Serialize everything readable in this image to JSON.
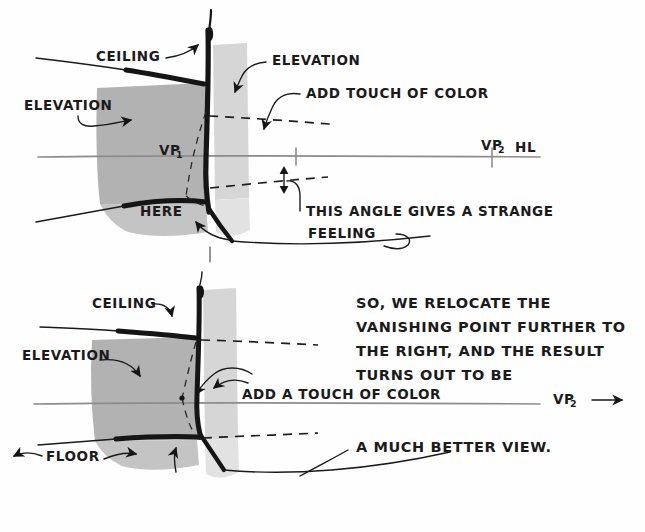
{
  "document": {
    "kind": "hand-drawn perspective drawing tutorial",
    "background_color": "#fefefe",
    "ink_color": "#151515",
    "horizon_color": "#8c8c8c",
    "wash_dark_color": "#b2b2b2",
    "wash_light_color": "#d6d6d6"
  },
  "top_panel": {
    "labels": {
      "ceiling": "CEILING",
      "elevation_left": "ELEVATION",
      "elevation_right": "ELEVATION",
      "add_touch_of_color": "ADD TOUCH OF COLOR",
      "vp1": "VP",
      "vp1_sub": "1",
      "vp2": "VP",
      "vp2_sub": "2",
      "hl": "HL",
      "here": "HERE",
      "angle_note_line1": "THIS ANGLE GIVES A STRANGE",
      "angle_note_line2": "FEELING"
    }
  },
  "bottom_panel": {
    "labels": {
      "ceiling": "CEILING",
      "elevation": "ELEVATION",
      "floor": "FLOOR",
      "add_a_touch_of_color": "ADD A TOUCH OF COLOR",
      "vp2": "VP",
      "vp2_sub": "2",
      "note_line1": "SO, WE RELOCATE THE",
      "note_line2": "VANISHING POINT FURTHER TO",
      "note_line3": "THE RIGHT, AND THE RESULT",
      "note_line4": "TURNS OUT TO BE",
      "conclusion": "A MUCH BETTER VIEW."
    }
  }
}
